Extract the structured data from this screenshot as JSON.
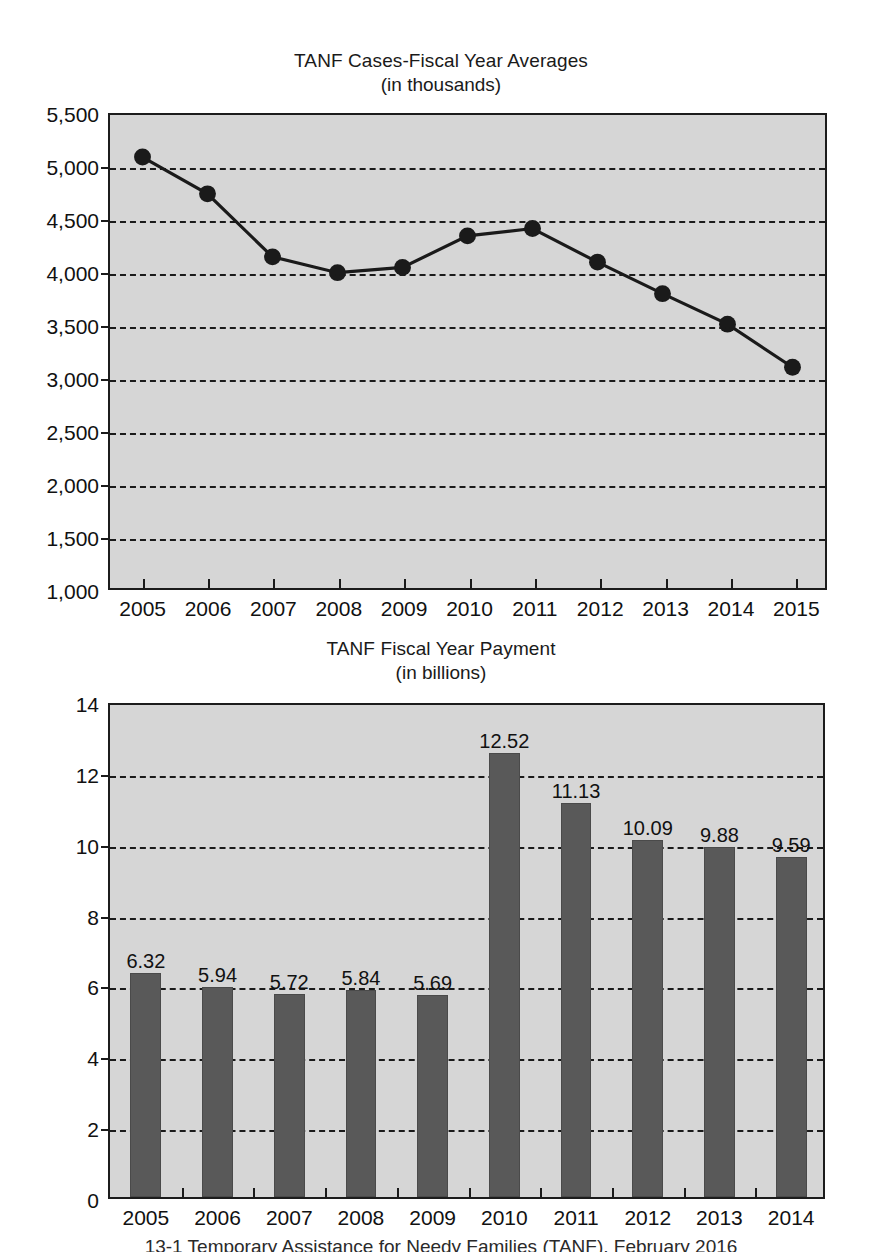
{
  "figure": {
    "caption": "13-1   Temporary Assistance for Needy Families (TANF), February 2016"
  },
  "charts": [
    {
      "title": "TANF Cases-Fiscal Year Averages",
      "subtitle": "(in thousands)"
    },
    {
      "title": "TANF Fiscal Year Payment",
      "subtitle": "(in billions)"
    }
  ],
  "chart_data": [
    {
      "type": "line",
      "title": "TANF Cases-Fiscal Year Averages",
      "subtitle": "(in thousands)",
      "xlabel": "",
      "ylabel": "",
      "categories": [
        "2005",
        "2006",
        "2007",
        "2008",
        "2009",
        "2010",
        "2011",
        "2012",
        "2013",
        "2014",
        "2015"
      ],
      "values": [
        5100,
        4750,
        4150,
        4000,
        4050,
        4350,
        4420,
        4100,
        3800,
        3510,
        3100
      ],
      "ylim": [
        1000,
        5500
      ],
      "ytick_values": [
        1000,
        1500,
        2000,
        2500,
        3000,
        3500,
        4000,
        4500,
        5000,
        5500
      ],
      "ytick_labels": [
        "1,000",
        "1,500",
        "2,000",
        "2,500",
        "3,000",
        "3,500",
        "4,000",
        "4,500",
        "5,000",
        "5,500"
      ],
      "grid": true,
      "grid_style": "dashed-horizontal",
      "legend": "none",
      "marker": "filled-circle",
      "line_color": "#1a1a1a",
      "plot_background": "#d6d6d6"
    },
    {
      "type": "bar",
      "title": "TANF Fiscal Year Payment",
      "subtitle": "(in billions)",
      "xlabel": "",
      "ylabel": "",
      "categories": [
        "2005",
        "2006",
        "2007",
        "2008",
        "2009",
        "2010",
        "2011",
        "2012",
        "2013",
        "2014"
      ],
      "values": [
        6.32,
        5.94,
        5.72,
        5.84,
        5.69,
        12.52,
        11.13,
        10.09,
        9.88,
        9.59
      ],
      "value_labels": [
        "6.32",
        "5.94",
        "5.72",
        "5.84",
        "5.69",
        "12.52",
        "11.13",
        "10.09",
        "9.88",
        "9.59"
      ],
      "ylim": [
        0,
        14
      ],
      "ytick_values": [
        0,
        2,
        4,
        6,
        8,
        10,
        12,
        14
      ],
      "ytick_labels": [
        "0",
        "2",
        "4",
        "6",
        "8",
        "10",
        "12",
        "14"
      ],
      "grid": true,
      "grid_style": "dashed-horizontal",
      "legend": "none",
      "bar_color": "#595959",
      "plot_background": "#d6d6d6"
    }
  ]
}
